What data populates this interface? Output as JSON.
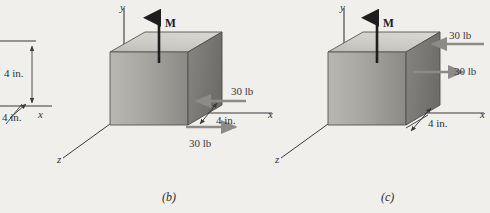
{
  "figure": {
    "background_color": "#f1efec",
    "ink_color": "#3a3a3a",
    "panels": [
      {
        "id": "panel-a-fragment",
        "caption": "",
        "axes": {
          "x_label": "x",
          "y_label": "",
          "z_label": ""
        },
        "dimensions": [
          {
            "label": "4 in."
          },
          {
            "label": "4 in."
          }
        ],
        "forces": [],
        "moment_label": ""
      },
      {
        "id": "panel-b",
        "caption": "(b)",
        "axes": {
          "x_label": "x",
          "y_label": "y",
          "z_label": "z"
        },
        "dimensions": [
          {
            "label": "4 in."
          }
        ],
        "forces": [
          {
            "label": "30 lb",
            "direction": "left"
          },
          {
            "label": "30 lb",
            "direction": "right"
          }
        ],
        "moment_label": "M",
        "body": {
          "shape": "cube",
          "edge_label": "4 in."
        }
      },
      {
        "id": "panel-c",
        "caption": "(c)",
        "axes": {
          "x_label": "x",
          "y_label": "y",
          "z_label": "z"
        },
        "dimensions": [
          {
            "label": "4 in."
          }
        ],
        "forces": [
          {
            "label": "30 lb",
            "direction": "left"
          },
          {
            "label": "30 lb",
            "direction": "right"
          }
        ],
        "moment_label": "M",
        "body": {
          "shape": "cube",
          "edge_label": "4 in."
        }
      }
    ],
    "colors": {
      "cube_top": "#c9c7c2",
      "cube_front_light": "#b4b2ad",
      "cube_front_dark": "#8e8c88",
      "cube_side": "#7c7a76",
      "outline": "#4a4a4a",
      "arrow": "#8d8b87",
      "moment_arrow": "#262626"
    }
  }
}
